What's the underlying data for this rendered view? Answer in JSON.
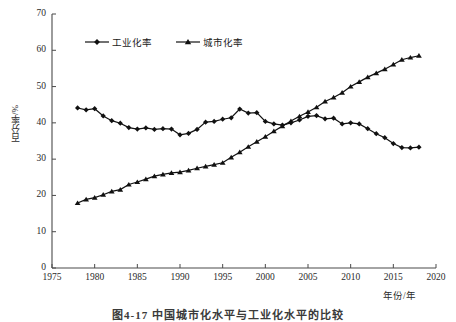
{
  "figure": {
    "caption": "图4-17  中国城市化水平与工业化水平的比较",
    "background_color": "#ffffff",
    "line_color": "#111111"
  },
  "chart_data": {
    "type": "line",
    "title": "",
    "xlabel": "年份/年",
    "ylabel": "百分率/%",
    "xlim": [
      1975,
      2020
    ],
    "ylim": [
      0,
      70
    ],
    "xticks": [
      1975,
      1980,
      1985,
      1990,
      1995,
      2000,
      2005,
      2010,
      2015,
      2020
    ],
    "xtick_labels": [
      "1975",
      "1980",
      "1985",
      "1990",
      "1995",
      "2000",
      "2005",
      "2010",
      "2015",
      "2020"
    ],
    "yticks": [
      0,
      10,
      20,
      30,
      40,
      50,
      60,
      70
    ],
    "ytick_labels": [
      "0",
      "10",
      "20",
      "30",
      "40",
      "50",
      "60",
      "70"
    ],
    "grid": false,
    "legend_position": "upper-left-inside",
    "x": [
      1978,
      1979,
      1980,
      1981,
      1982,
      1983,
      1984,
      1985,
      1986,
      1987,
      1988,
      1989,
      1990,
      1991,
      1992,
      1993,
      1994,
      1995,
      1996,
      1997,
      1998,
      1999,
      2000,
      2001,
      2002,
      2003,
      2004,
      2005,
      2006,
      2007,
      2008,
      2009,
      2010,
      2011,
      2012,
      2013,
      2014,
      2015,
      2016,
      2017,
      2018
    ],
    "series": [
      {
        "name": "工业化率",
        "marker": "diamond",
        "values": [
          44.1,
          43.6,
          43.9,
          41.9,
          40.6,
          39.9,
          38.7,
          38.3,
          38.6,
          38.2,
          38.4,
          38.3,
          36.7,
          37.1,
          38.2,
          40.2,
          40.4,
          41.0,
          41.4,
          43.8,
          42.7,
          42.8,
          40.4,
          39.7,
          39.4,
          40.0,
          40.8,
          41.8,
          42.0,
          41.1,
          41.3,
          39.7,
          40.0,
          39.7,
          38.4,
          37.0,
          35.9,
          34.3,
          33.2,
          33.1,
          33.3
        ]
      },
      {
        "name": "城市化率",
        "marker": "triangle",
        "values": [
          17.9,
          18.9,
          19.4,
          20.2,
          21.1,
          21.6,
          23.0,
          23.7,
          24.5,
          25.3,
          25.8,
          26.2,
          26.4,
          26.9,
          27.5,
          28.0,
          28.5,
          29.0,
          30.5,
          31.9,
          33.4,
          34.8,
          36.2,
          37.7,
          39.1,
          40.5,
          41.8,
          43.0,
          44.3,
          45.9,
          47.0,
          48.3,
          50.0,
          51.3,
          52.6,
          53.7,
          54.8,
          56.1,
          57.4,
          58.0,
          58.5
        ]
      }
    ],
    "legend": [
      {
        "label": "工业化率",
        "marker": "diamond"
      },
      {
        "label": "城市化率",
        "marker": "triangle"
      }
    ]
  }
}
